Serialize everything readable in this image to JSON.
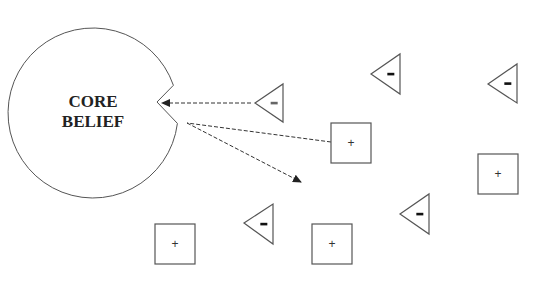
{
  "diagram": {
    "core": {
      "label_line1": "CORE",
      "label_line2": "BELIEF",
      "center": [
        93,
        113
      ],
      "radius": 85
    },
    "colors": {
      "stroke": "#555555",
      "arrow": "#333333",
      "text": "#222222",
      "background": "#ffffff"
    },
    "shapes": [
      {
        "id": "t1",
        "type": "triangle",
        "sign": "-",
        "tip": [
          255,
          103
        ],
        "right_x": 283,
        "top_y": 84,
        "bottom_y": 122
      },
      {
        "id": "s1",
        "type": "square",
        "sign": "+",
        "x": 331,
        "y": 123,
        "size": 40
      },
      {
        "id": "t2",
        "type": "triangle",
        "sign": "-",
        "tip": [
          371,
          74
        ],
        "right_x": 400,
        "top_y": 54,
        "bottom_y": 94
      },
      {
        "id": "t3",
        "type": "triangle",
        "sign": "-",
        "tip": [
          488,
          84
        ],
        "right_x": 517,
        "top_y": 64,
        "bottom_y": 103
      },
      {
        "id": "s2",
        "type": "square",
        "sign": "+",
        "x": 478,
        "y": 154,
        "size": 40
      },
      {
        "id": "s3",
        "type": "square",
        "sign": "+",
        "x": 155,
        "y": 224,
        "size": 40
      },
      {
        "id": "t4",
        "type": "triangle",
        "sign": "-",
        "tip": [
          244,
          223
        ],
        "right_x": 273,
        "top_y": 204,
        "bottom_y": 244
      },
      {
        "id": "s4",
        "type": "square",
        "sign": "+",
        "x": 312,
        "y": 224,
        "size": 40
      },
      {
        "id": "t5",
        "type": "triangle",
        "sign": "-",
        "tip": [
          400,
          214
        ],
        "right_x": 429,
        "top_y": 194,
        "bottom_y": 234
      }
    ],
    "arrows": [
      {
        "id": "a1",
        "from": [
          251,
          103
        ],
        "to": [
          162,
          103
        ],
        "style": "dashed",
        "head": "end"
      },
      {
        "id": "a2",
        "from": [
          331,
          142
        ],
        "to": [
          187,
          123
        ],
        "style": "dashed",
        "head": "none"
      },
      {
        "id": "a3",
        "from": [
          187,
          123
        ],
        "to": [
          301,
          182
        ],
        "style": "dashed",
        "head": "end"
      }
    ]
  }
}
